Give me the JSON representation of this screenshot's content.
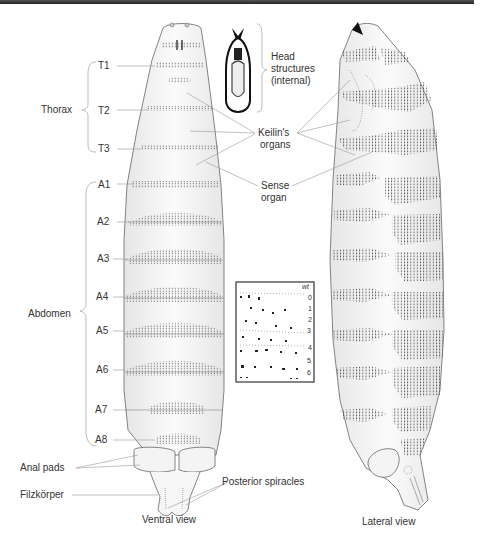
{
  "figure": {
    "views": [
      {
        "id": "ventral",
        "caption": "Ventral view"
      },
      {
        "id": "lateral",
        "caption": "Lateral view"
      }
    ],
    "regions": [
      {
        "label": "Thorax",
        "segments": [
          "T1",
          "T2",
          "T3"
        ]
      },
      {
        "label": "Abdomen",
        "segments": [
          "A1",
          "A2",
          "A3",
          "A4",
          "A5",
          "A6",
          "A7",
          "A8"
        ]
      }
    ],
    "segment_labels": {
      "T1": "T1",
      "T2": "T2",
      "T3": "T3",
      "A1": "A1",
      "A2": "A2",
      "A3": "A3",
      "A4": "A4",
      "A5": "A5",
      "A6": "A6",
      "A7": "A7",
      "A8": "A8"
    },
    "annotations": {
      "head_structures_line1": "Head",
      "head_structures_line2": "structures",
      "head_structures_line3": "(internal)",
      "keilins_line1": "Keilin's",
      "keilins_line2": "organs",
      "sense_line1": "Sense",
      "sense_line2": "organ",
      "anal_pads": "Anal pads",
      "filzkorper": "Filzkörper",
      "posterior_spiracles": "Posterior spiracles"
    },
    "region_labels": {
      "thorax": "Thorax",
      "abdomen": "Abdomen"
    },
    "inset": {
      "title": "wt",
      "row_numbers": [
        "0",
        "1",
        "2",
        "3",
        "4",
        "5",
        "6"
      ]
    },
    "colors": {
      "outline": "#555555",
      "leader_line": "#999999",
      "denticle": "#555555",
      "body_fill": "#f4f4f4",
      "top_bar": "#333333"
    }
  }
}
